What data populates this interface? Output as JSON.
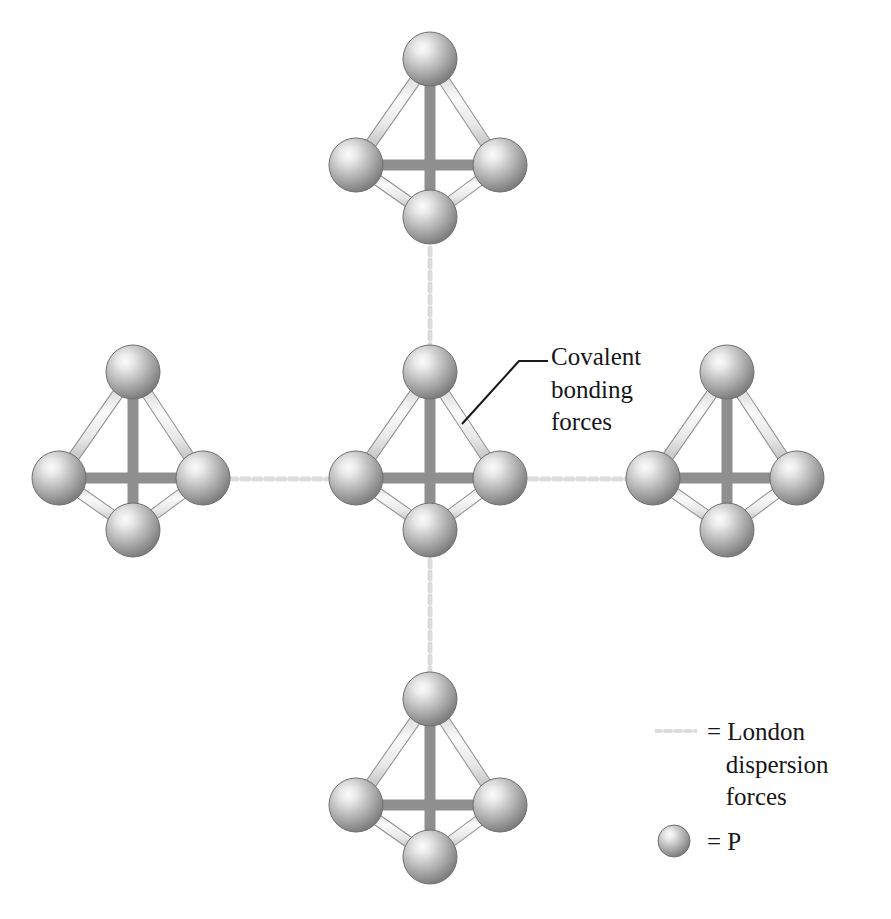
{
  "figure": {
    "type": "molecular-diagram",
    "background_color": "#ffffff",
    "width": 891,
    "height": 919
  },
  "annotations": {
    "covalent": {
      "lines": [
        "Covalent",
        "bonding",
        "forces"
      ],
      "text": "Covalent\nbonding\nforces",
      "leader_points": "462,424 519,361 548,361"
    }
  },
  "legend": {
    "items": [
      {
        "swatch": "dashed-line",
        "equals": "=",
        "lines": [
          "London",
          "dispersion",
          "forces"
        ],
        "text": "= London\n   dispersion\n   forces"
      },
      {
        "swatch": "sphere",
        "equals": "=",
        "lines": [
          "P"
        ],
        "text": "= P"
      }
    ]
  },
  "colors": {
    "sphere_highlight": "#f2f2f2",
    "sphere_mid": "#9d9d9d",
    "sphere_edge": "#5d5d5d",
    "sphere_outline": "#6b6b6b",
    "bond_light": "#efefef",
    "bond_mid": "#c8c8c8",
    "bond_edge": "#8a8a8a",
    "dispersion_line": "#dedede",
    "leader_line": "#1a1a1a",
    "text": "#17161a",
    "background": "#ffffff"
  },
  "molecules": [
    {
      "name": "top-molecule",
      "cx": 430,
      "cy": 139,
      "r": 104,
      "atoms": 4
    },
    {
      "name": "left-molecule",
      "cx": 133,
      "cy": 452,
      "r": 104,
      "atoms": 4
    },
    {
      "name": "center-molecule",
      "cx": 430,
      "cy": 452,
      "r": 104,
      "atoms": 4
    },
    {
      "name": "right-molecule",
      "cx": 727,
      "cy": 452,
      "r": 104,
      "atoms": 4
    },
    {
      "name": "bottom-molecule",
      "cx": 430,
      "cy": 779,
      "r": 104,
      "atoms": 4
    }
  ],
  "atom_offsets": {
    "apex": {
      "dx": 0,
      "dy": -80,
      "r": 27
    },
    "left": {
      "dx": -74,
      "dy": 26,
      "r": 27
    },
    "right": {
      "dx": 70,
      "dy": 26,
      "r": 27
    },
    "front": {
      "dx": 0,
      "dy": 78,
      "r": 27
    }
  },
  "dispersion_connectors": [
    {
      "name": "connector-top",
      "x1": 430,
      "y1": 248,
      "x2": 430,
      "y2": 345
    },
    {
      "name": "connector-bottom",
      "x1": 430,
      "y1": 560,
      "x2": 430,
      "y2": 672
    },
    {
      "name": "connector-left",
      "x1": 218,
      "y1": 479,
      "x2": 340,
      "y2": 479
    },
    {
      "name": "connector-right",
      "x1": 518,
      "y1": 479,
      "x2": 638,
      "y2": 479
    }
  ]
}
